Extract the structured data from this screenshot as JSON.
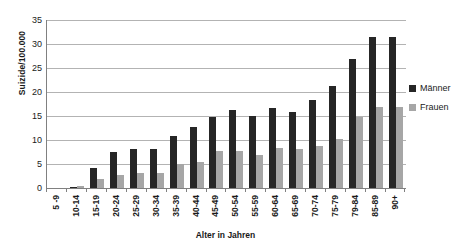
{
  "chart_data": {
    "type": "bar",
    "title": "",
    "xlabel": "Alter in Jahren",
    "ylabel": "Suizide/100.000",
    "ylim": [
      0,
      35
    ],
    "ytick_step": 5,
    "yticks": [
      "35",
      "30",
      "25",
      "20",
      "15",
      "10",
      "5",
      "0"
    ],
    "grid": true,
    "legend_position": "right",
    "categories": [
      "5 -9",
      "10-14",
      "15-19",
      "20-24",
      "25-29",
      "30-34",
      "35-39",
      "40-44",
      "45-49",
      "50-54",
      "55-59",
      "60-64",
      "65-69",
      "70-74",
      "75-79",
      "79-84",
      "85-89",
      "90+"
    ],
    "series": [
      {
        "name": "Männer",
        "color": "#262626",
        "values": [
          0.0,
          0.2,
          4.2,
          7.5,
          8.2,
          8.2,
          10.8,
          12.7,
          14.8,
          16.2,
          15.0,
          16.7,
          15.8,
          18.4,
          21.2,
          26.8,
          31.4,
          31.4
        ]
      },
      {
        "name": "Frauen",
        "color": "#a6a6a6",
        "values": [
          0.0,
          0.4,
          1.8,
          2.8,
          3.2,
          3.1,
          5.0,
          5.4,
          7.7,
          7.7,
          6.9,
          8.3,
          8.2,
          8.7,
          10.2,
          14.8,
          16.8,
          16.9
        ]
      }
    ]
  },
  "legend": {
    "items": [
      {
        "label": "Männer",
        "color": "#262626"
      },
      {
        "label": "Frauen",
        "color": "#a6a6a6"
      }
    ]
  }
}
